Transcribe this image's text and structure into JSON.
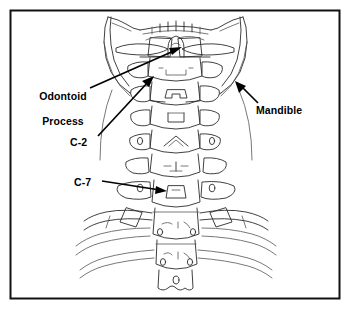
{
  "figure": {
    "background_color": "#ffffff",
    "frame_color": "#111111",
    "line_color": "#2b2b2b",
    "label_color": "#000000"
  },
  "labels": {
    "odontoid_line1": "Odontoid",
    "odontoid_line2": "Process",
    "c2": "C-2",
    "c7": "C-7",
    "mandible": "Mandible"
  },
  "annotations": [
    {
      "id": "odontoid-process",
      "text": "Odontoid Process",
      "label_x": 57,
      "label_y": 90,
      "target_x": 181,
      "target_y": 47,
      "points_to": "dens of the axis"
    },
    {
      "id": "c2",
      "text": "C-2",
      "label_x": 84,
      "label_y": 142,
      "target_x": 152,
      "target_y": 77,
      "points_to": "second cervical vertebra"
    },
    {
      "id": "c7",
      "text": "C-7",
      "label_x": 87,
      "label_y": 182,
      "target_x": 166,
      "target_y": 191,
      "points_to": "seventh cervical vertebra"
    },
    {
      "id": "mandible",
      "text": "Mandible",
      "label_x": 283,
      "label_y": 110,
      "target_x": 236,
      "target_y": 83,
      "points_to": "lower jaw bone"
    }
  ]
}
